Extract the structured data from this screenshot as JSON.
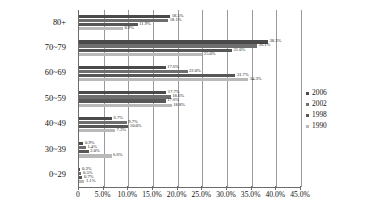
{
  "chart_data": {
    "type": "bar",
    "orientation": "horizontal",
    "title": "",
    "xlabel": "",
    "ylabel": "",
    "xlim": [
      0,
      45
    ],
    "grid": true,
    "legend_position": "right",
    "categories": [
      "80+",
      "70~79",
      "60~69",
      "50~59",
      "40~49",
      "30~39",
      "0~29"
    ],
    "xticks": [
      "0",
      "5.0%",
      "10.0%",
      "15.0%",
      "20.0%",
      "25.0%",
      "30.0%",
      "35.0%",
      "40.0%",
      "45.0%"
    ],
    "xtick_values": [
      0,
      5,
      10,
      15,
      20,
      25,
      30,
      35,
      40,
      45
    ],
    "series": [
      {
        "name": "2006",
        "color": "#4a4a4a",
        "values": [
          18.5,
          38.3,
          17.6,
          17.7,
          6.7,
          0.9,
          0.3
        ],
        "labels": [
          "18.5%",
          "38.3%",
          "17.6%",
          "17.7%",
          "6.7%",
          "0.9%",
          "0.3%"
        ]
      },
      {
        "name": "2002",
        "color": "#6e6e6e",
        "values": [
          18.1,
          36.1,
          22.0,
          18.6,
          9.7,
          1.4,
          0.5
        ],
        "labels": [
          "18.1%",
          "36.1%",
          "22.0%",
          "18.6%",
          "9.7%",
          "1.4%",
          "0.5%"
        ]
      },
      {
        "name": "1998",
        "color": "#575757",
        "values": [
          11.9,
          31.0,
          31.7,
          17.6,
          10.0,
          2.0,
          0.7
        ],
        "labels": [
          "11.9%",
          "31.0%",
          "31.7%",
          "17.6%",
          "10.0%",
          "2.0%",
          "0.7%"
        ]
      },
      {
        "name": "1990",
        "color": "#b9b9b9",
        "values": [
          8.9,
          25.0,
          34.3,
          18.8,
          7.3,
          6.6,
          1.1
        ],
        "labels": [
          "8.9%",
          "25.0%",
          "34.3%",
          "18.8%",
          "7.3%",
          "6.6%",
          "1.1%"
        ]
      }
    ]
  }
}
